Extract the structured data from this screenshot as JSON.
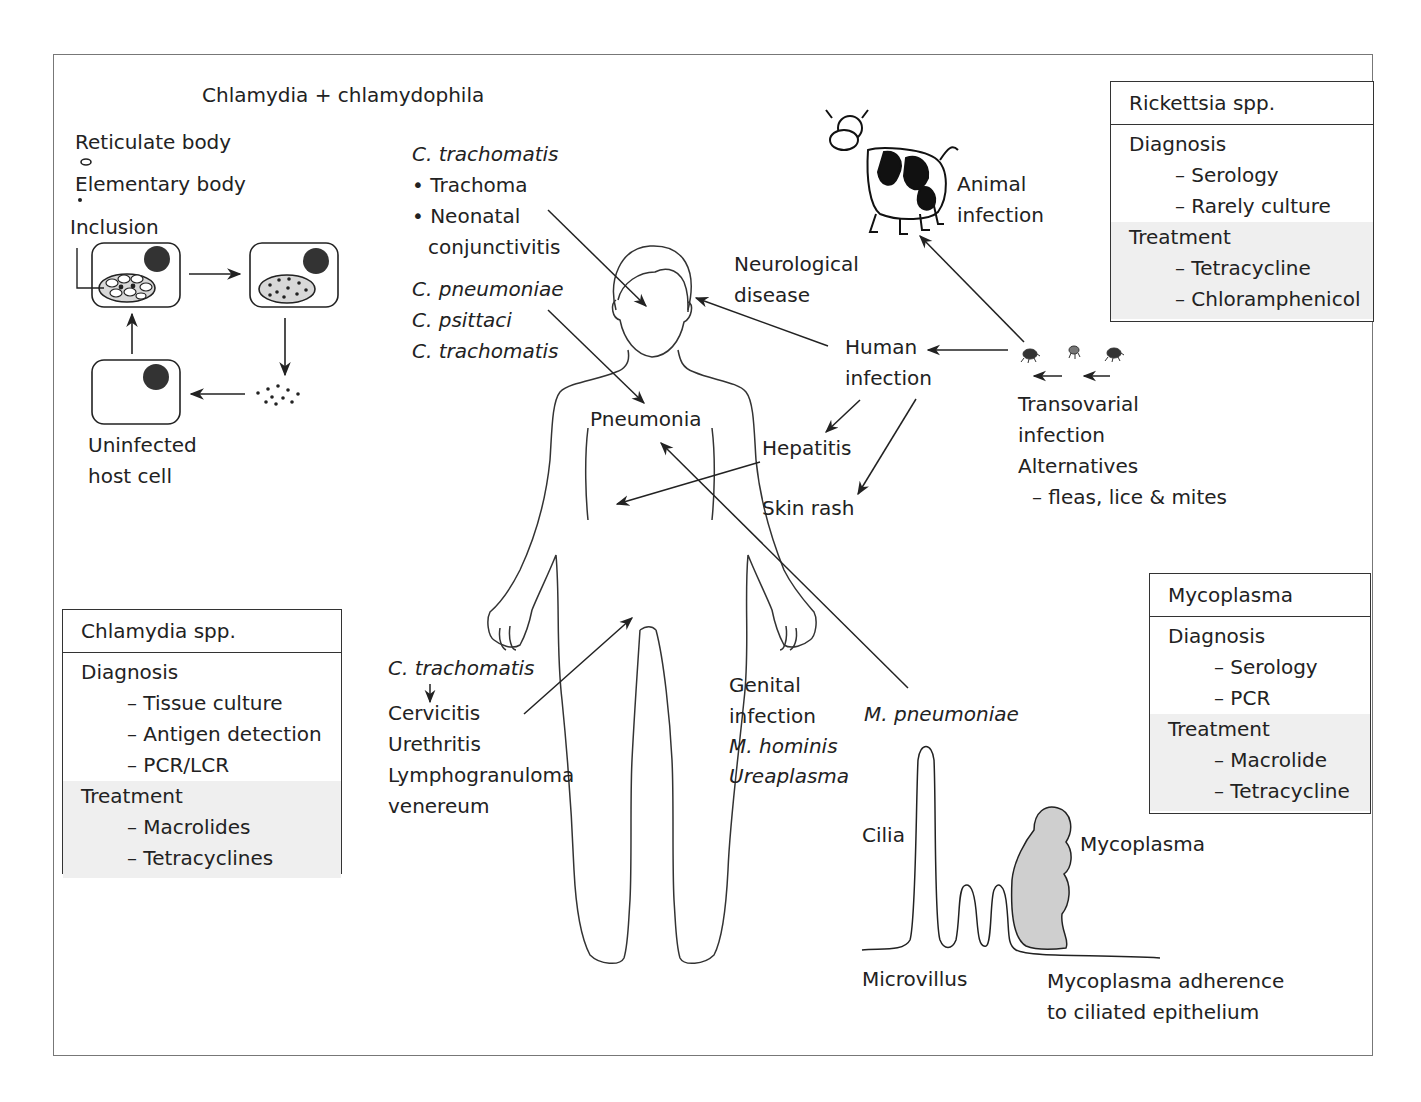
{
  "chlamydia_cycle": {
    "title": "Chlamydia + chlamydophila",
    "reticulate_body": "Reticulate body",
    "elementary_body": "Elementary body",
    "inclusion": "Inclusion",
    "uninfected_line1": "Uninfected",
    "uninfected_line2": "host cell"
  },
  "left_labels": {
    "c_trachomatis_1": "C. trachomatis",
    "trachoma": "• Trachoma",
    "neonatal": "• Neonatal",
    "conjunctivitis": "conjunctivitis",
    "c_pneumoniae": "C. pneumoniae",
    "c_psittaci": "C. psittaci",
    "c_trachomatis_2": "C. trachomatis",
    "c_trachomatis_3": "C. trachomatis",
    "cervicitis": "Cervicitis",
    "urethritis": "Urethritis",
    "lympho": "Lymphogranuloma",
    "venereum": "venereum"
  },
  "body_labels": {
    "pneumonia": "Pneumonia",
    "neuro_1": "Neurological",
    "neuro_2": "disease",
    "human_1": "Human",
    "human_2": "infection",
    "hepatitis": "Hepatitis",
    "skin_rash": "Skin rash",
    "genital_1": "Genital",
    "genital_2": "infection",
    "m_hominis": "M. hominis",
    "ureaplasma": "Ureaplasma",
    "m_pneumoniae": "M. pneumoniae"
  },
  "rickettsia_labels": {
    "animal_1": "Animal",
    "animal_2": "infection",
    "transovarial_1": "Transovarial",
    "transovarial_2": "infection",
    "alternatives": "Alternatives",
    "vectors": "– fleas, lice & mites"
  },
  "mycoplasma_diagram": {
    "cilia": "Cilia",
    "mycoplasma": "Mycoplasma",
    "microvillus": "Microvillus",
    "caption_1": "Mycoplasma adherence",
    "caption_2": "to ciliated epithelium"
  },
  "boxes": {
    "rickettsia": {
      "title": "Rickettsia spp.",
      "diagnosis_label": "Diagnosis",
      "diagnosis": [
        "– Serology",
        "– Rarely culture"
      ],
      "treatment_label": "Treatment",
      "treatment": [
        "– Tetracycline",
        "– Chloramphenicol"
      ]
    },
    "chlamydia": {
      "title": "Chlamydia spp.",
      "diagnosis_label": "Diagnosis",
      "diagnosis": [
        "– Tissue culture",
        "– Antigen detection",
        "– PCR/LCR"
      ],
      "treatment_label": "Treatment",
      "treatment": [
        "– Macrolides",
        "– Tetracyclines"
      ]
    },
    "mycoplasma": {
      "title": "Mycoplasma",
      "diagnosis_label": "Diagnosis",
      "diagnosis": [
        "– Serology",
        "– PCR"
      ],
      "treatment_label": "Treatment",
      "treatment": [
        "– Macrolide",
        "– Tetracycline"
      ]
    }
  },
  "colors": {
    "line": "#222222",
    "frame": "#777777",
    "treatment_fill": "#efefef",
    "inclusion_fill": "#d8d8d8",
    "mycoplasma_fill": "#cfcfcf",
    "nucleus": "#333333"
  }
}
